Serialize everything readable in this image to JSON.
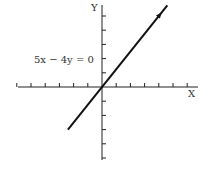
{
  "diagram": {
    "x_axis_label": "X",
    "y_axis_label": "Y",
    "equation_label": "5x − 4y = 0",
    "x_ticks": [
      -6,
      -5,
      -4,
      -3,
      -2,
      -1,
      1,
      2,
      3,
      4,
      5,
      6
    ],
    "y_ticks": [
      -5,
      -4,
      -3,
      -2,
      -1,
      1,
      2,
      3,
      4,
      5
    ],
    "line": {
      "slope": 1.25,
      "intercept": 0,
      "x_from": -2.4,
      "x_to": 4.6,
      "arrow_at_end": true
    },
    "colors": {
      "axis": "#222222",
      "line": "#111111",
      "text": "#333333"
    }
  }
}
